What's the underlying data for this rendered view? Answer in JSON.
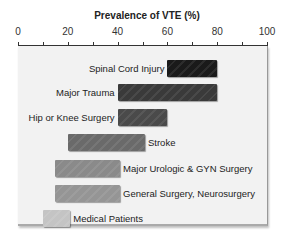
{
  "chart_data": {
    "type": "bar",
    "orientation": "horizontal-range",
    "title": "Prevalence of VTE (%)",
    "xlabel": "Prevalence of VTE (%)",
    "ylabel": "",
    "xlim": [
      0,
      100
    ],
    "x_ticks": [
      0,
      20,
      40,
      60,
      80,
      100
    ],
    "minor_ticks": [
      10,
      30,
      50,
      70,
      90
    ],
    "grid": false,
    "legend": null,
    "categories": [
      "Spinal Cord Injury",
      "Major Trauma",
      "Hip or Knee Surgery",
      "Stroke",
      "Major Urologic & GYN Surgery",
      "General Surgery, Neurosurgery",
      "Medical Patients"
    ],
    "ranges": [
      {
        "label": "Spinal Cord Injury",
        "low": 60,
        "high": 80,
        "color": "#1a1a1a",
        "label_side": "left"
      },
      {
        "label": "Major Trauma",
        "low": 40,
        "high": 80,
        "color": "#3a3a3a",
        "label_side": "left"
      },
      {
        "label": "Hip or Knee Surgery",
        "low": 40,
        "high": 60,
        "color": "#4a4a4a",
        "label_side": "left"
      },
      {
        "label": "Stroke",
        "low": 20,
        "high": 51,
        "color": "#6a6a6a",
        "label_side": "right"
      },
      {
        "label": "Major Urologic & GYN Surgery",
        "low": 15,
        "high": 41,
        "color": "#8a8a8a",
        "label_side": "right"
      },
      {
        "label": "General Surgery, Neurosurgery",
        "low": 15,
        "high": 41,
        "color": "#959595",
        "label_side": "right"
      },
      {
        "label": "Medical Patients",
        "low": 10,
        "high": 21,
        "color": "#c4c4c4",
        "label_side": "right"
      }
    ]
  }
}
